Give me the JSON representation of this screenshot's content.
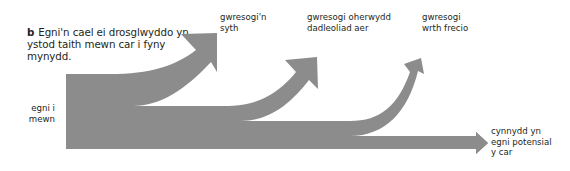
{
  "caption": {
    "letter": "b",
    "text": "Egni'n cael ei drosglwyddo yn ystod taith mewn car i fyny mynydd."
  },
  "labels": {
    "input": "egni i\nmewn",
    "heat_straight": "gwresogi'n\nsyth",
    "heat_air": "gwresogi oherwydd\ndadleoliad aer",
    "heat_braking": "gwresogi\nwrth frecio",
    "potential": "cynnydd yn\negni potensial\ny car"
  },
  "colors": {
    "flow_fill": "#8c8c8c",
    "text": "#231f20",
    "background": "#ffffff"
  },
  "diagram": {
    "type": "sankey",
    "input": "egni i mewn",
    "outputs": [
      {
        "name": "gwresogi'n syth",
        "relative_width": 32
      },
      {
        "name": "gwresogi oherwydd dadleoliad aer",
        "relative_width": 15
      },
      {
        "name": "gwresogi wrth frecio",
        "relative_width": 15
      },
      {
        "name": "cynnydd yn egni potensial y car",
        "relative_width": 13
      }
    ]
  }
}
